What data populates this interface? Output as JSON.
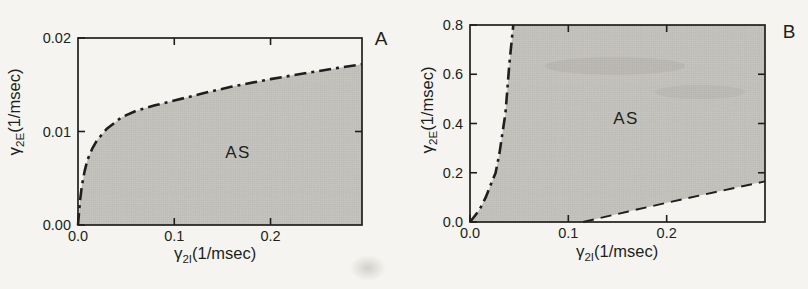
{
  "figure": {
    "colors": {
      "background": "#f5f4f0",
      "ink": "#201f1d",
      "shade_base": "#cbc9c4",
      "shade_dot": "#b9b7b1",
      "smudge": "#8e8d87"
    }
  },
  "chart_data": [
    {
      "type": "area",
      "panel_label": "A",
      "region_label": "AS",
      "xlabel": {
        "sym": "γ",
        "sub": "2I",
        "unit": "(1/msec)"
      },
      "ylabel": {
        "sym": "γ",
        "sub": "2E",
        "unit": "(1/msec)"
      },
      "xlim": [
        0,
        0.295
      ],
      "ylim": [
        0,
        0.02
      ],
      "xticks": {
        "values": [
          0,
          0.1,
          0.2
        ],
        "labels": [
          "0.0",
          "0.1",
          "0.2"
        ]
      },
      "yticks": {
        "values": [
          0,
          0.01,
          0.02
        ],
        "labels": [
          "0.00",
          "0.01",
          "0.02"
        ]
      },
      "top_ticks": [
        0.1,
        0.2
      ],
      "right_ticks": [
        0.01
      ],
      "grid": false,
      "boundaries": [
        {
          "name": "as-upper-boundary",
          "line_style": "dash-dot",
          "points": [
            [
              0,
              0
            ],
            [
              0.002,
              0.0025
            ],
            [
              0.004,
              0.0042
            ],
            [
              0.007,
              0.0058
            ],
            [
              0.01,
              0.007
            ],
            [
              0.015,
              0.0082
            ],
            [
              0.02,
              0.0091
            ],
            [
              0.03,
              0.0103
            ],
            [
              0.045,
              0.0115
            ],
            [
              0.06,
              0.0122
            ],
            [
              0.08,
              0.0128
            ],
            [
              0.1,
              0.0133
            ],
            [
              0.13,
              0.0141
            ],
            [
              0.16,
              0.0148
            ],
            [
              0.2,
              0.0156
            ],
            [
              0.24,
              0.0163
            ],
            [
              0.27,
              0.0168
            ],
            [
              0.295,
              0.0172
            ]
          ]
        }
      ],
      "shaded_region": {
        "label": "AS",
        "polygon": [
          [
            0,
            0
          ],
          [
            0.002,
            0.0025
          ],
          [
            0.004,
            0.0042
          ],
          [
            0.007,
            0.0058
          ],
          [
            0.01,
            0.007
          ],
          [
            0.015,
            0.0082
          ],
          [
            0.02,
            0.0091
          ],
          [
            0.03,
            0.0103
          ],
          [
            0.045,
            0.0115
          ],
          [
            0.06,
            0.0122
          ],
          [
            0.08,
            0.0128
          ],
          [
            0.1,
            0.0133
          ],
          [
            0.13,
            0.0141
          ],
          [
            0.16,
            0.0148
          ],
          [
            0.2,
            0.0156
          ],
          [
            0.24,
            0.0163
          ],
          [
            0.27,
            0.0168
          ],
          [
            0.295,
            0.0172
          ],
          [
            0.295,
            0
          ]
        ]
      }
    },
    {
      "type": "area",
      "panel_label": "B",
      "region_label": "AS",
      "xlabel": {
        "sym": "γ",
        "sub": "2I",
        "unit": "(1/msec)"
      },
      "ylabel": {
        "sym": "γ",
        "sub": "2E",
        "unit": "(1/msec)"
      },
      "xlim": [
        0,
        0.3
      ],
      "ylim": [
        0,
        0.8
      ],
      "xticks": {
        "values": [
          0,
          0.1,
          0.2
        ],
        "labels": [
          "0.0",
          "0.1",
          "0.2"
        ]
      },
      "yticks": {
        "values": [
          0,
          0.2,
          0.4,
          0.6,
          0.8
        ],
        "labels": [
          "0.0",
          "0.2",
          "0.4",
          "0.6",
          "0.8"
        ]
      },
      "top_ticks": [
        0.1,
        0.2
      ],
      "right_ticks": [
        0.2,
        0.4,
        0.6
      ],
      "grid": false,
      "boundaries": [
        {
          "name": "as-left-boundary",
          "line_style": "dash-dot",
          "points": [
            [
              0,
              0
            ],
            [
              0.006,
              0.03
            ],
            [
              0.011,
              0.06
            ],
            [
              0.016,
              0.1
            ],
            [
              0.021,
              0.15
            ],
            [
              0.026,
              0.2
            ],
            [
              0.03,
              0.28
            ],
            [
              0.033,
              0.36
            ],
            [
              0.036,
              0.44
            ],
            [
              0.038,
              0.54
            ],
            [
              0.04,
              0.64
            ],
            [
              0.042,
              0.72
            ],
            [
              0.044,
              0.8
            ]
          ]
        },
        {
          "name": "as-lower-boundary",
          "line_style": "dashed",
          "points": [
            [
              0.115,
              0
            ],
            [
              0.16,
              0.042
            ],
            [
              0.2,
              0.078
            ],
            [
              0.25,
              0.122
            ],
            [
              0.3,
              0.165
            ]
          ]
        }
      ],
      "shaded_region": {
        "label": "AS",
        "polygon": [
          [
            0,
            0
          ],
          [
            0.006,
            0.03
          ],
          [
            0.011,
            0.06
          ],
          [
            0.016,
            0.1
          ],
          [
            0.021,
            0.15
          ],
          [
            0.026,
            0.2
          ],
          [
            0.03,
            0.28
          ],
          [
            0.033,
            0.36
          ],
          [
            0.036,
            0.44
          ],
          [
            0.038,
            0.54
          ],
          [
            0.04,
            0.64
          ],
          [
            0.042,
            0.72
          ],
          [
            0.044,
            0.8
          ],
          [
            0.3,
            0.8
          ],
          [
            0.3,
            0.165
          ],
          [
            0.25,
            0.122
          ],
          [
            0.2,
            0.078
          ],
          [
            0.16,
            0.042
          ],
          [
            0.115,
            0
          ]
        ]
      }
    }
  ]
}
